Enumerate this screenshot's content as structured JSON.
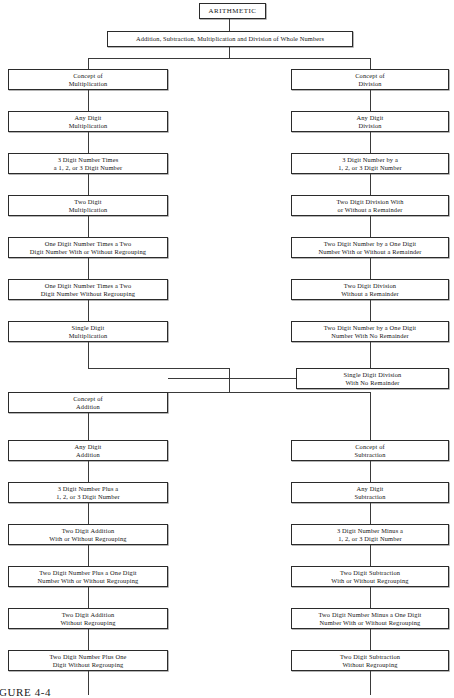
{
  "figure": {
    "caption": "FIGURE 4-4"
  },
  "root": {
    "label": "ARITHMETIC"
  },
  "banner": {
    "label": "Addition, Subtraction, Multiplication and Division of Whole Numbers"
  },
  "columns": {
    "multiplication": {
      "heading": "Concept of Multiplication",
      "nodes": [
        {
          "line1": "Concept of",
          "line2": "Multiplication"
        },
        {
          "line1": "Any Digit",
          "line2": "Multiplication"
        },
        {
          "line1": "3 Digit Number Times",
          "line2": "a 1, 2, or 3 Digit Number"
        },
        {
          "line1": "Two Digit",
          "line2": "Multiplication"
        },
        {
          "line1": "One Digit Number Times a Two",
          "line2": "Digit Number With or Without Regrouping"
        },
        {
          "line1": "One Digit Number Times a Two",
          "line2": "Digit Number Without Regrouping"
        },
        {
          "line1": "Single Digit",
          "line2": "Multiplication"
        }
      ]
    },
    "division": {
      "heading": "Concept of Division",
      "nodes": [
        {
          "line1": "Concept of",
          "line2": "Division"
        },
        {
          "line1": "Any Digit",
          "line2": "Division"
        },
        {
          "line1": "3 Digit Number by a",
          "line2": "1, 2, or 3 Digit Number"
        },
        {
          "line1": "Two Digit Division With",
          "line2": "or Without a Remainder"
        },
        {
          "line1": "Two Digit Number by a One Digit",
          "line2": "Number With or Without a Remainder"
        },
        {
          "line1": "Two Digit Division",
          "line2": "Without a Remainder"
        },
        {
          "line1": "Two Digit Number by a One Digit",
          "line2": "Number With No Remainder"
        },
        {
          "line1": "Single Digit Division",
          "line2": "With No Remainder"
        }
      ]
    },
    "addition": {
      "heading": "Concept of Addition",
      "nodes": [
        {
          "line1": "Concept of",
          "line2": "Addition"
        },
        {
          "line1": "Any Digit",
          "line2": "Addition"
        },
        {
          "line1": "3 Digit Number Plus a",
          "line2": "1, 2, or 3 Digit Number"
        },
        {
          "line1": "Two Digit Addition",
          "line2": "With or Without Regrouping"
        },
        {
          "line1": "Two Digit Number Plus a One Digit",
          "line2": "Number With or Without Regrouping"
        },
        {
          "line1": "Two Digit Addition",
          "line2": "Without Regrouping"
        },
        {
          "line1": "Two Digit Number Plus One",
          "line2": "Digit Without Regrouping"
        }
      ]
    },
    "subtraction": {
      "heading": "Concept of Subtraction",
      "nodes": [
        {
          "line1": "Concept of",
          "line2": "Subtraction"
        },
        {
          "line1": "Any Digit",
          "line2": "Subtraction"
        },
        {
          "line1": "3 Digit Number Minus a",
          "line2": "1, 2, or 3 Digit Number"
        },
        {
          "line1": "Two Digit Subtraction",
          "line2": "With or Without Regrouping"
        },
        {
          "line1": "Two Digit Number Minus a One Digit",
          "line2": "Number With or Without Regrouping"
        },
        {
          "line1": "Two Digit Subtraction",
          "line2": "Without Regrouping"
        }
      ]
    }
  }
}
